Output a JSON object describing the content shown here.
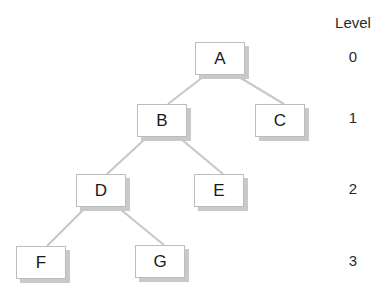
{
  "diagram": {
    "type": "binary-tree",
    "level_header": "Level",
    "levels": [
      {
        "label": "0",
        "y": 57
      },
      {
        "label": "1",
        "y": 118
      },
      {
        "label": "2",
        "y": 189
      },
      {
        "label": "3",
        "y": 261
      }
    ],
    "nodes": [
      {
        "id": "A",
        "label": "A",
        "level": 0,
        "x": 195,
        "y": 42
      },
      {
        "id": "B",
        "label": "B",
        "level": 1,
        "x": 137,
        "y": 104
      },
      {
        "id": "C",
        "label": "C",
        "level": 1,
        "x": 255,
        "y": 104
      },
      {
        "id": "D",
        "label": "D",
        "level": 2,
        "x": 76,
        "y": 174
      },
      {
        "id": "E",
        "label": "E",
        "level": 2,
        "x": 194,
        "y": 174
      },
      {
        "id": "F",
        "label": "F",
        "level": 3,
        "x": 16,
        "y": 246
      },
      {
        "id": "G",
        "label": "G",
        "level": 3,
        "x": 135,
        "y": 245
      }
    ],
    "edges": [
      {
        "from": "A",
        "to": "B"
      },
      {
        "from": "A",
        "to": "C"
      },
      {
        "from": "B",
        "to": "D"
      },
      {
        "from": "B",
        "to": "E"
      },
      {
        "from": "D",
        "to": "F"
      },
      {
        "from": "D",
        "to": "G"
      }
    ],
    "colors": {
      "edge": "#c8c8c8",
      "node_border": "#bdbdbd",
      "shadow": "#c9c9c9",
      "text": "#1a1a1a"
    }
  }
}
